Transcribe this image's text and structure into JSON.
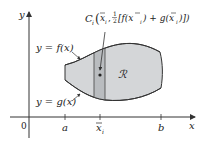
{
  "figure": {
    "type": "region-between-curves-centroid",
    "axes": {
      "x_label": "x",
      "y_label": "y",
      "origin_label": "0"
    },
    "ticks": {
      "a": "a",
      "xi_bar": "x",
      "xi_sub": "i",
      "b": "b"
    },
    "curves": {
      "upper_label": "y = f(x)",
      "lower_label": "y = g(x)"
    },
    "region_label": "ℛ",
    "centroid_label": {
      "prefix": "C",
      "sub": "i",
      "open": "(",
      "xbar": "x",
      "xsub": "i",
      "comma": ",",
      "half_num": "1",
      "half_den": "2",
      "bracket_expr": "[f(x",
      "bracket_mid": ") + g(x",
      "bracket_end": ")])",
      "sub2": "i",
      "sub3": "i"
    },
    "colors": {
      "region_fill": "#d4d6d8",
      "strip_fill": "#b9bcbf",
      "outline": "#333333",
      "axis": "#333333"
    }
  }
}
